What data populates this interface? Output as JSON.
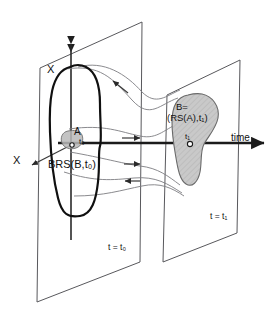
{
  "figure": {
    "type": "schematic-diagram"
  },
  "labels": {
    "axis_x_top": "X",
    "axis_x_side": "X",
    "axis_time": "time",
    "brs_region": "BRS(B,t₀)",
    "set_a": "A",
    "set_a_time": "t₀",
    "set_b_line1": "B=",
    "set_b_line2": "(RS(A),t₁)",
    "tick_t1": "t₁",
    "plane_left": "t = t₀",
    "plane_right": "t = t₁"
  },
  "colors": {
    "background": "#ffffff",
    "plane_edge": "#58585c",
    "axis": "#1b1b1b",
    "brs_outline": "#101010",
    "flow_curve": "#7d7d81",
    "blob_a_fill": "#b8b8b8",
    "blob_b_fill": "#c9c9c9",
    "text": "#111111"
  },
  "geometry": {
    "plane_left_corners": "40,68 142,22 140,262 37,302",
    "plane_right_corners": "167,95 240,60 237,233 163,262",
    "time_axis": "y=143 from x=58 to x=266",
    "tick_t1_x": 190
  }
}
